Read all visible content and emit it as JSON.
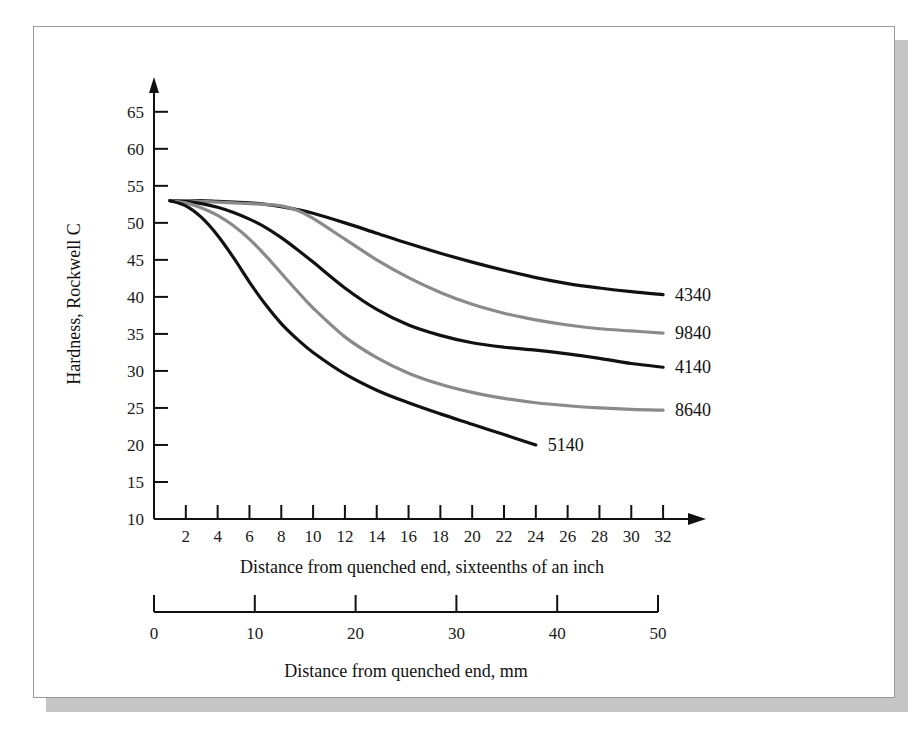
{
  "chart_data": {
    "type": "line",
    "title": "",
    "xlabel": "Distance from quenched end, sixteenths of an inch",
    "xlabel2": "Distance from quenched end, mm",
    "ylabel": "Hardness, Rockwell C",
    "xlim": [
      0,
      33
    ],
    "ylim": [
      10,
      67
    ],
    "xticks": [
      0,
      2,
      4,
      6,
      8,
      10,
      12,
      14,
      16,
      18,
      20,
      22,
      24,
      26,
      28,
      30,
      32
    ],
    "xticklabels": [
      "0",
      "2",
      "4",
      "6",
      "8",
      "10",
      "12",
      "14",
      "16",
      "18",
      "20",
      "22",
      "24",
      "26",
      "28",
      "30",
      "32"
    ],
    "yticks": [
      10,
      15,
      20,
      25,
      30,
      35,
      40,
      45,
      50,
      55,
      60,
      65
    ],
    "yticklabels": [
      "10",
      "15",
      "20",
      "25",
      "30",
      "35",
      "40",
      "45",
      "50",
      "55",
      "60",
      "65"
    ],
    "secondary_axis": {
      "label": "Distance from quenched end, mm",
      "ticks": [
        0,
        10,
        20,
        30,
        40,
        50
      ],
      "ticklabels": [
        "0",
        "10",
        "20",
        "30",
        "40",
        "50"
      ],
      "range": [
        0,
        50
      ],
      "unit": "mm"
    },
    "grid": false,
    "legend": "inline-end-labels",
    "series": [
      {
        "name": "4340",
        "color": "#111111",
        "label": "4340",
        "x": [
          1,
          2,
          3,
          4,
          5,
          6,
          7,
          8,
          9,
          10,
          12,
          14,
          16,
          18,
          20,
          22,
          24,
          26,
          28,
          30,
          32
        ],
        "y": [
          53,
          53,
          53,
          52.9,
          52.8,
          52.7,
          52.5,
          52.2,
          51.8,
          51.3,
          50.0,
          48.6,
          47.2,
          45.9,
          44.7,
          43.6,
          42.6,
          41.8,
          41.2,
          40.7,
          40.3
        ]
      },
      {
        "name": "9840",
        "color": "#8a8a8a",
        "label": "9840",
        "x": [
          1,
          2,
          3,
          4,
          5,
          6,
          7,
          8,
          9,
          10,
          12,
          14,
          16,
          18,
          20,
          22,
          24,
          26,
          28,
          30,
          32
        ],
        "y": [
          53,
          53,
          52.9,
          52.8,
          52.7,
          52.6,
          52.5,
          52.3,
          51.7,
          50.6,
          47.8,
          45.0,
          42.6,
          40.6,
          39.0,
          37.8,
          36.9,
          36.2,
          35.7,
          35.4,
          35.1
        ]
      },
      {
        "name": "4140",
        "color": "#111111",
        "label": "4140",
        "x": [
          1,
          2,
          3,
          4,
          5,
          6,
          7,
          8,
          9,
          10,
          12,
          14,
          16,
          18,
          20,
          22,
          24,
          26,
          28,
          30,
          32
        ],
        "y": [
          53,
          52.9,
          52.6,
          52.1,
          51.4,
          50.5,
          49.4,
          48.0,
          46.4,
          44.7,
          41.2,
          38.3,
          36.2,
          34.8,
          33.8,
          33.2,
          32.8,
          32.3,
          31.7,
          31.0,
          30.5
        ]
      },
      {
        "name": "8640",
        "color": "#8a8a8a",
        "label": "8640",
        "x": [
          1,
          2,
          3,
          4,
          5,
          6,
          7,
          8,
          9,
          10,
          12,
          14,
          16,
          18,
          20,
          22,
          24,
          26,
          28,
          30,
          32
        ],
        "y": [
          53,
          52.7,
          52.0,
          51.0,
          49.6,
          47.8,
          45.6,
          43.2,
          40.8,
          38.5,
          34.6,
          31.8,
          29.7,
          28.2,
          27.1,
          26.3,
          25.7,
          25.3,
          25.0,
          24.8,
          24.7
        ]
      },
      {
        "name": "5140",
        "color": "#111111",
        "label": "5140",
        "x": [
          1,
          2,
          3,
          4,
          5,
          6,
          7,
          8,
          9,
          10,
          12,
          14,
          16,
          18,
          20,
          22,
          24
        ],
        "y": [
          53,
          52.3,
          50.7,
          48.3,
          45.3,
          42.0,
          39.0,
          36.4,
          34.3,
          32.5,
          29.6,
          27.4,
          25.7,
          24.2,
          22.8,
          21.4,
          20.0
        ]
      }
    ]
  },
  "figure": {
    "background": "#ffffff",
    "frame_color": "#9a9a9a",
    "shadow_color": "#c6c6c6",
    "axis_color": "#111111",
    "black_series_color": "#111111",
    "gray_series_color": "#8a8a8a"
  }
}
